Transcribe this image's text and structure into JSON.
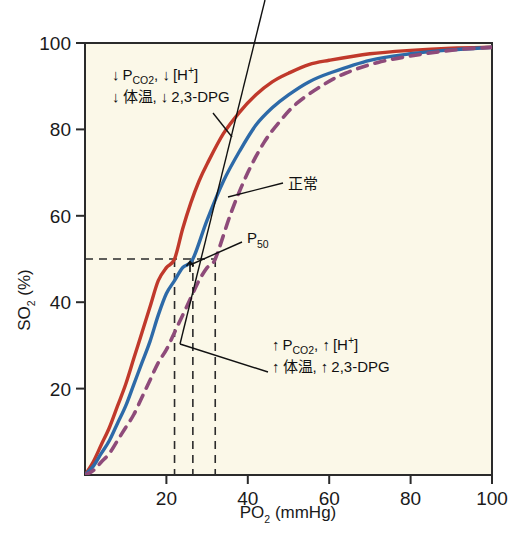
{
  "figure": {
    "background_color": "#ffffff",
    "plot_background_color": "#fbf8e8",
    "frame_color": "#2b2b2b"
  },
  "chart_data": {
    "type": "line",
    "title": "",
    "xlabel": "PO₂ (mmHg)",
    "ylabel": "SO₂ (%)",
    "xlim": [
      0,
      100
    ],
    "ylim": [
      0,
      100
    ],
    "xticks": [
      0,
      20,
      40,
      60,
      80,
      100
    ],
    "xtick_labels": [
      "",
      "20",
      "40",
      "60",
      "80",
      "100"
    ],
    "yticks": [
      0,
      20,
      40,
      60,
      80,
      100
    ],
    "ytick_labels": [
      "",
      "20",
      "40",
      "60",
      "80",
      "100"
    ],
    "grid": false,
    "legend_position": "none",
    "series": [
      {
        "name": "left-shifted",
        "label": "↓ PCO₂, ↓ [H⁺] / ↓ 体温, ↓ 2,3-DPG",
        "color": "#c0392b",
        "style": "solid",
        "p50": 22,
        "x": [
          0,
          2,
          4,
          6,
          8,
          10,
          12,
          14,
          16,
          18,
          20,
          22,
          24,
          26,
          28,
          30,
          34,
          38,
          42,
          46,
          50,
          55,
          60,
          70,
          80,
          90,
          100
        ],
        "y": [
          0,
          3,
          7,
          11,
          16,
          21,
          27,
          33,
          39,
          45,
          48,
          50,
          57,
          63,
          68,
          72,
          79,
          84,
          88,
          91,
          93,
          95,
          96,
          97.5,
          98.3,
          98.8,
          99
        ]
      },
      {
        "name": "normal",
        "label": "正常",
        "color": "#2d6aa8",
        "style": "solid",
        "p50": 26.5,
        "x": [
          0,
          2,
          4,
          6,
          8,
          10,
          12,
          14,
          16,
          18,
          20,
          22,
          24,
          26.5,
          30,
          34,
          38,
          42,
          46,
          50,
          55,
          60,
          70,
          80,
          90,
          100
        ],
        "y": [
          0,
          2,
          5,
          8,
          12,
          16,
          21,
          26,
          31,
          37,
          42,
          45,
          48,
          50,
          59,
          68,
          75,
          81,
          85,
          88,
          91,
          93,
          96,
          97.5,
          98.4,
          99
        ]
      },
      {
        "name": "right-shifted",
        "label": "↑ PCO₂, ↑ [H⁺] / ↑ 体温, ↑ 2,3-DPG",
        "color": "#8e4b7a",
        "style": "dashed",
        "p50": 32,
        "x": [
          0,
          2,
          4,
          6,
          8,
          10,
          12,
          14,
          16,
          18,
          20,
          22,
          24,
          26,
          28,
          30,
          32,
          36,
          40,
          44,
          48,
          52,
          58,
          64,
          72,
          82,
          92,
          100
        ],
        "y": [
          0,
          1,
          3,
          5,
          8,
          11,
          14,
          18,
          22,
          26,
          29,
          33,
          37,
          41,
          45,
          48,
          50,
          61,
          70,
          77,
          82,
          86,
          90,
          93,
          95.5,
          97.3,
          98.5,
          99
        ]
      }
    ],
    "reference_lines": {
      "horizontal": [
        {
          "value": 50,
          "style": "dashed",
          "color": "#2b2b2b"
        }
      ],
      "vertical": [
        {
          "value": 22,
          "style": "dashed",
          "color": "#2b2b2b"
        },
        {
          "value": 26.5,
          "style": "dashed",
          "color": "#2b2b2b"
        },
        {
          "value": 32,
          "style": "dashed",
          "color": "#2b2b2b"
        }
      ]
    },
    "annotations": [
      {
        "name": "left-shift-annotation",
        "line1_arrow": "↓",
        "line1_a": "P",
        "line1_a_sub": "CO2",
        "line1_b": ", ",
        "line1_arrow2": "↓",
        "line1_c": "[H",
        "line1_c_sup": "+",
        "line1_d": "]",
        "line2_arrow": "↓",
        "line2_a": "体温, ",
        "line2_arrow2": "↓",
        "line2_b": "2,3-DPG"
      },
      {
        "name": "right-shift-annotation",
        "line1_arrow": "↑",
        "line1_a": "P",
        "line1_a_sub": "CO2",
        "line1_b": ", ",
        "line1_arrow2": "↑",
        "line1_c": "[H",
        "line1_c_sup": "+",
        "line1_d": "]",
        "line2_arrow": "↑",
        "line2_a": "体温, ",
        "line2_arrow2": "↑",
        "line2_b": "2,3-DPG"
      },
      {
        "name": "normal-curve-annotation",
        "text": "正常"
      },
      {
        "name": "p50-annotation",
        "text": "P",
        "sub": "50"
      }
    ]
  },
  "axes": {
    "x": {
      "title_main": "PO",
      "title_sub": "2",
      "title_unit": " (mmHg)",
      "ticks": [
        "20",
        "40",
        "60",
        "80",
        "100"
      ]
    },
    "y": {
      "title_main": "SO",
      "title_sub": "2",
      "title_unit": " (%)",
      "ticks": [
        "100",
        "80",
        "60",
        "40",
        "20"
      ]
    }
  }
}
